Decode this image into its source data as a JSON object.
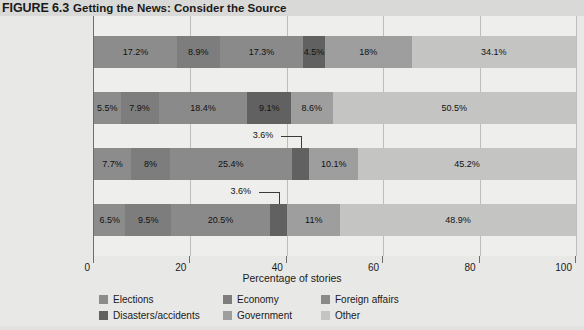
{
  "figure": {
    "number": "FIGURE 6.3",
    "title": "Getting the News: Consider the Source"
  },
  "chart_data": {
    "type": "bar",
    "orientation": "horizontal",
    "stacked": true,
    "title": "Getting the News: Consider the Source",
    "xlabel": "Percentage of stories",
    "ylabel": "",
    "xlim": [
      0,
      100
    ],
    "xticks": [
      0,
      20,
      40,
      60,
      80,
      100
    ],
    "xtick_labels": [
      "0",
      "20",
      "40",
      "60",
      "80",
      "100"
    ],
    "grid": true,
    "legend_position": "bottom",
    "categories": [
      "Cable TV",
      "Network TV",
      "Online news",
      "Newspapers"
    ],
    "series": [
      {
        "name": "Elections",
        "color": "#8c8c8c",
        "values": [
          17.2,
          5.5,
          7.7,
          6.5
        ],
        "labels": [
          "17.2%",
          "5.5%",
          "7.7%",
          "6.5%"
        ]
      },
      {
        "name": "Economy",
        "color": "#7d7d7d",
        "values": [
          8.9,
          7.9,
          8.0,
          9.5
        ],
        "labels": [
          "8.9%",
          "7.9%",
          "8%",
          "9.5%"
        ]
      },
      {
        "name": "Foreign affairs",
        "color": "#8a8a8a",
        "values": [
          17.3,
          18.4,
          25.4,
          20.5
        ],
        "labels": [
          "17.3%",
          "18.4%",
          "25.4%",
          "20.5%"
        ]
      },
      {
        "name": "Disasters/accidents",
        "color": "#616161",
        "values": [
          4.5,
          9.1,
          3.6,
          3.6
        ],
        "labels": [
          "4.5%",
          "9.1%",
          "3.6%",
          "3.6%"
        ]
      },
      {
        "name": "Government",
        "color": "#9e9e9e",
        "values": [
          18.0,
          8.6,
          10.1,
          11.0
        ],
        "labels": [
          "18%",
          "8.6%",
          "10.1%",
          "11%"
        ]
      },
      {
        "name": "Other",
        "color": "#c4c4c2",
        "values": [
          34.1,
          50.5,
          45.2,
          48.9
        ],
        "labels": [
          "34.1%",
          "50.5%",
          "45.2%",
          "48.9%"
        ]
      }
    ],
    "callouts": [
      {
        "category": "Online news",
        "series": "Disasters/accidents",
        "text": "3.6%"
      },
      {
        "category": "Newspapers",
        "series": "Disasters/accidents",
        "text": "3.6%"
      }
    ]
  },
  "legend": {
    "items": [
      {
        "label": "Elections",
        "color": "#8c8c8c"
      },
      {
        "label": "Economy",
        "color": "#7d7d7d"
      },
      {
        "label": "Foreign affairs",
        "color": "#8a8a8a"
      },
      {
        "label": "Disasters/accidents",
        "color": "#616161"
      },
      {
        "label": "Government",
        "color": "#9e9e9e"
      },
      {
        "label": "Other",
        "color": "#c4c4c2"
      }
    ]
  },
  "axis": {
    "x_title": "Percentage of stories"
  }
}
